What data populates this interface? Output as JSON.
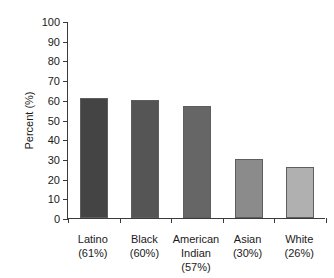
{
  "chart_data": {
    "type": "bar",
    "title": "",
    "subtitle": "",
    "xlabel": "",
    "ylabel": "Percent (%)",
    "ylim": [
      0,
      100
    ],
    "y_ticks": [
      0,
      10,
      20,
      30,
      40,
      50,
      60,
      70,
      80,
      90,
      100
    ],
    "y_tick_labels": [
      "0",
      "10",
      "20",
      "30",
      "40",
      "50",
      "60",
      "70",
      "80",
      "90",
      "100"
    ],
    "grid": false,
    "legend": "none",
    "categories": [
      "Latino",
      "Black",
      "American Indian",
      "Asian",
      "White"
    ],
    "category_label_lines": [
      [
        "Latino",
        "(61%)"
      ],
      [
        "Black",
        "(60%)"
      ],
      [
        "American",
        "Indian",
        "(57%)"
      ],
      [
        "Asian",
        "(30%)"
      ],
      [
        "White",
        "(26%)"
      ]
    ],
    "values": [
      61,
      60,
      57,
      30,
      26
    ],
    "value_labels": [
      "61%",
      "60%",
      "57%",
      "30%",
      "26%"
    ],
    "bar_colors": [
      "#444444",
      "#555555",
      "#666666",
      "#8b8b8b",
      "#b0b0b0"
    ],
    "bar_edge_color": "#5e5e5e",
    "axis_color": "#3a3a3a",
    "text_color": "#1a1a1a",
    "background_color": "#ffffff"
  }
}
